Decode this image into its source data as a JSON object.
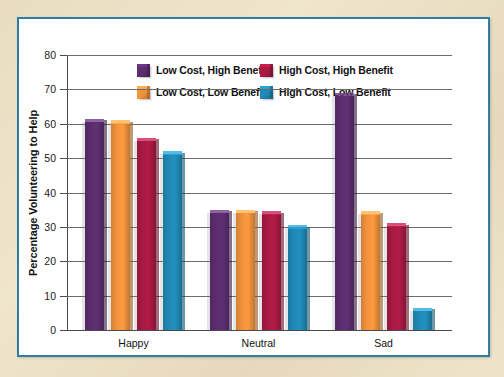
{
  "chart_data": {
    "type": "bar",
    "title": "",
    "xlabel": "",
    "ylabel": "Percentage Volunteering to Help",
    "ylim": [
      0,
      80
    ],
    "yticks": [
      0,
      10,
      20,
      30,
      40,
      50,
      60,
      70,
      80
    ],
    "ytick_labels": [
      "0",
      "10",
      "20",
      "30",
      "40",
      "50",
      "60",
      "70",
      "80"
    ],
    "grid": true,
    "legend_position": "top-center",
    "categories": [
      "Happy",
      "Neutral",
      "Sad"
    ],
    "series": [
      {
        "name": "Low Cost, High Benefit",
        "color": "#5b2d6e",
        "values": [
          61.5,
          35.0,
          69.0
        ]
      },
      {
        "name": "Low Cost, Low Benefit",
        "color": "#f0923c",
        "values": [
          61.0,
          35.0,
          34.5
        ]
      },
      {
        "name": "High Cost, High Benefit",
        "color": "#a81943",
        "values": [
          56.0,
          34.5,
          31.0
        ]
      },
      {
        "name": "High Cost, Low Benefit",
        "color": "#2089b5",
        "values": [
          52.0,
          30.5,
          6.5
        ]
      }
    ]
  },
  "frame": {
    "border_color": "#2e7fa3",
    "mat_color": "#ead9b8"
  }
}
